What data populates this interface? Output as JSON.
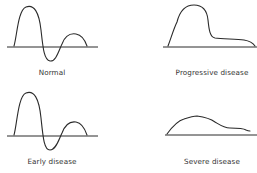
{
  "panels": [
    {
      "id": "normal",
      "label": "Normal"
    },
    {
      "id": "progressive",
      "label": "Progressive disease"
    },
    {
      "id": "early",
      "label": "Early disease"
    },
    {
      "id": "severe",
      "label": "Severe disease"
    }
  ],
  "colors": {
    "stroke": "#2a2a2a",
    "text": "#333333",
    "background": "#ffffff"
  }
}
